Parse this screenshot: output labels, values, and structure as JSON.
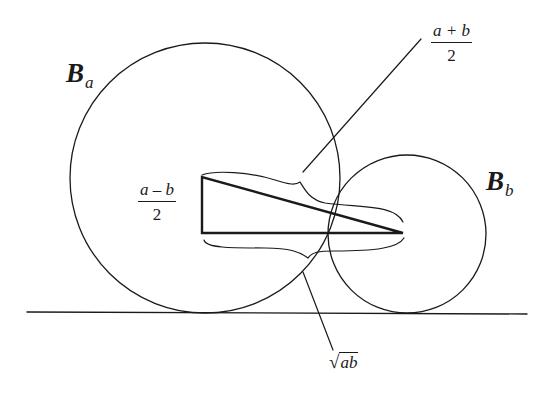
{
  "figure": {
    "colors": {
      "stroke": "#1a1a1a",
      "background": "#ffffff"
    }
  },
  "labels": {
    "circle_a": {
      "main": "B",
      "sub": "a"
    },
    "circle_b": {
      "main": "B",
      "sub": "b"
    },
    "half_sum": {
      "numerator": "a + b",
      "denominator": "2"
    },
    "half_diff": {
      "numerator": "a – b",
      "denominator": "2"
    },
    "geo_mean": {
      "radical": "√",
      "radicand": "ab"
    }
  },
  "geometry": {
    "ground_line": {
      "x1": 27,
      "y1": 312,
      "x2": 527,
      "y2": 314
    },
    "circle_a": {
      "cx": 205,
      "cy": 178,
      "r": 135
    },
    "circle_b": {
      "cx": 407,
      "cy": 234,
      "r": 79
    },
    "triangle": {
      "top": [
        202,
        177
      ],
      "corner": [
        202,
        233
      ],
      "apex": [
        403,
        233
      ]
    }
  }
}
